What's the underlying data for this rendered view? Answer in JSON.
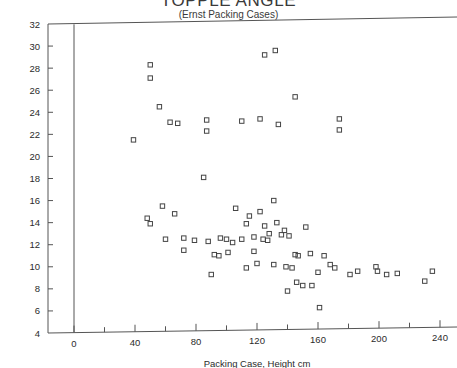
{
  "chart_data": {
    "type": "scatter",
    "title": "TOPPLE ANGLE",
    "subtitle": "(Ernst Packing Cases)",
    "xlabel": "Packing Case, Height cm",
    "ylabel": "",
    "xlim": [
      -12,
      252
    ],
    "ylim": [
      4,
      32
    ],
    "xticks": [
      0,
      40,
      80,
      120,
      160,
      200,
      240
    ],
    "xticks_minor": [
      20,
      60,
      100,
      140,
      180,
      220
    ],
    "yticks": [
      4,
      6,
      8,
      10,
      12,
      14,
      16,
      18,
      20,
      22,
      24,
      26,
      28,
      30,
      32
    ],
    "grid": false,
    "legend": "none",
    "marker": "open-square",
    "marker_color": "#444444",
    "points": [
      {
        "x": 50,
        "y": 28.3
      },
      {
        "x": 50,
        "y": 27.1
      },
      {
        "x": 125,
        "y": 29.2
      },
      {
        "x": 132,
        "y": 29.6
      },
      {
        "x": 145,
        "y": 25.4
      },
      {
        "x": 56,
        "y": 24.5
      },
      {
        "x": 63,
        "y": 23.1
      },
      {
        "x": 68,
        "y": 23.0
      },
      {
        "x": 87,
        "y": 23.3
      },
      {
        "x": 87,
        "y": 22.3
      },
      {
        "x": 39,
        "y": 21.5
      },
      {
        "x": 110,
        "y": 23.2
      },
      {
        "x": 122,
        "y": 23.4
      },
      {
        "x": 134,
        "y": 22.9
      },
      {
        "x": 174,
        "y": 23.4
      },
      {
        "x": 174,
        "y": 22.4
      },
      {
        "x": 85,
        "y": 18.1
      },
      {
        "x": 58,
        "y": 15.5
      },
      {
        "x": 66,
        "y": 14.8
      },
      {
        "x": 48,
        "y": 14.4
      },
      {
        "x": 50,
        "y": 13.9
      },
      {
        "x": 106,
        "y": 15.3
      },
      {
        "x": 115,
        "y": 14.6
      },
      {
        "x": 122,
        "y": 15.0
      },
      {
        "x": 131,
        "y": 16.0
      },
      {
        "x": 113,
        "y": 13.9
      },
      {
        "x": 125,
        "y": 13.7
      },
      {
        "x": 133,
        "y": 14.0
      },
      {
        "x": 138,
        "y": 13.3
      },
      {
        "x": 152,
        "y": 13.6
      },
      {
        "x": 128,
        "y": 13.0
      },
      {
        "x": 136,
        "y": 12.9
      },
      {
        "x": 141,
        "y": 12.8
      },
      {
        "x": 60,
        "y": 12.5
      },
      {
        "x": 72,
        "y": 12.6
      },
      {
        "x": 79,
        "y": 12.4
      },
      {
        "x": 88,
        "y": 12.3
      },
      {
        "x": 96,
        "y": 12.6
      },
      {
        "x": 100,
        "y": 12.5
      },
      {
        "x": 104,
        "y": 12.2
      },
      {
        "x": 110,
        "y": 12.5
      },
      {
        "x": 118,
        "y": 12.7
      },
      {
        "x": 124,
        "y": 12.5
      },
      {
        "x": 127,
        "y": 12.4
      },
      {
        "x": 72,
        "y": 11.5
      },
      {
        "x": 92,
        "y": 11.1
      },
      {
        "x": 95,
        "y": 11.0
      },
      {
        "x": 101,
        "y": 11.3
      },
      {
        "x": 118,
        "y": 11.4
      },
      {
        "x": 145,
        "y": 11.1
      },
      {
        "x": 147,
        "y": 11.0
      },
      {
        "x": 155,
        "y": 11.2
      },
      {
        "x": 164,
        "y": 11.0
      },
      {
        "x": 90,
        "y": 9.3
      },
      {
        "x": 113,
        "y": 9.9
      },
      {
        "x": 120,
        "y": 10.3
      },
      {
        "x": 131,
        "y": 10.2
      },
      {
        "x": 139,
        "y": 10.0
      },
      {
        "x": 143,
        "y": 9.9
      },
      {
        "x": 160,
        "y": 9.5
      },
      {
        "x": 168,
        "y": 10.2
      },
      {
        "x": 171,
        "y": 9.9
      },
      {
        "x": 181,
        "y": 9.3
      },
      {
        "x": 186,
        "y": 9.6
      },
      {
        "x": 198,
        "y": 10.0
      },
      {
        "x": 199,
        "y": 9.6
      },
      {
        "x": 205,
        "y": 9.3
      },
      {
        "x": 212,
        "y": 9.4
      },
      {
        "x": 235,
        "y": 9.6
      },
      {
        "x": 230,
        "y": 8.7
      },
      {
        "x": 146,
        "y": 8.6
      },
      {
        "x": 150,
        "y": 8.3
      },
      {
        "x": 156,
        "y": 8.3
      },
      {
        "x": 140,
        "y": 7.8
      },
      {
        "x": 161,
        "y": 6.3
      }
    ]
  }
}
